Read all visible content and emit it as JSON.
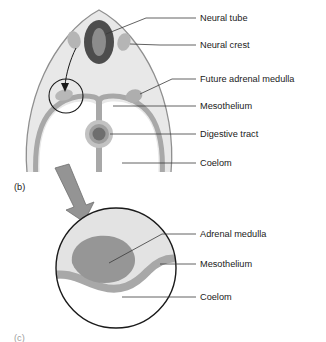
{
  "figure": {
    "panel_label_b": "(b)",
    "panel_label_c": "(c)"
  },
  "main_diagram": {
    "title": "Embryo cross-section showing neural crest migration",
    "labels": [
      {
        "id": "neural-tube",
        "text": "Neural tube"
      },
      {
        "id": "neural-crest",
        "text": "Neural crest"
      },
      {
        "id": "future-adrenal-medulla",
        "text": "Future adrenal medulla"
      },
      {
        "id": "mesothelium",
        "text": "Mesothelium"
      },
      {
        "id": "digestive-tract",
        "text": "Digestive tract"
      },
      {
        "id": "coelom",
        "text": "Coelom"
      }
    ]
  },
  "inset_diagram": {
    "title": "Magnified view of developing adrenal medulla",
    "labels": [
      {
        "id": "adrenal-medulla",
        "text": "Adrenal medulla"
      },
      {
        "id": "mesothelium",
        "text": "Mesothelium"
      },
      {
        "id": "coelom",
        "text": "Coelom"
      }
    ]
  },
  "colors": {
    "background": "#ffffff",
    "body_fill": "#e8e8e8",
    "body_outline": "#7d7d7d",
    "neural_tube_dark": "#4a4a4a",
    "neural_tube_lumen": "#8c8c8c",
    "neural_crest": "#b5b5b5",
    "mesothelium_band": "#a8a8a8",
    "digestive_tract_outer": "#c2c2c2",
    "digestive_tract_mid": "#9e9e9e",
    "digestive_tract_core": "#6e6e6e",
    "adrenal_medulla": "#9a9a9a",
    "inset_upper_fill": "#e3e3e3",
    "arrow": "#8a8a8a",
    "leader_line": "#3a3a3a",
    "text": "#1a1a1a"
  }
}
